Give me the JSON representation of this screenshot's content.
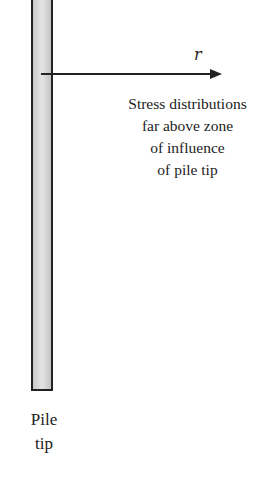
{
  "diagram": {
    "axis_label": "r",
    "annotation_lines": [
      "Stress distributions",
      "far above zone",
      "of influence",
      "of pile tip"
    ],
    "pile_tip_label_lines": [
      "Pile",
      "tip"
    ],
    "colors": {
      "stroke": "#222222",
      "pile_fill": "#d6d6d6"
    }
  }
}
